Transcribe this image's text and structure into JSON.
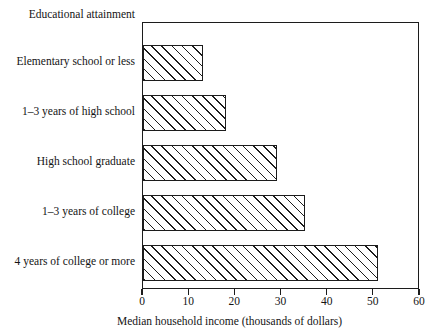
{
  "chart_data": {
    "type": "bar",
    "orientation": "horizontal",
    "title": "",
    "series_title": "Educational attainment",
    "categories": [
      "Elementary school or less",
      "1–3 years of high school",
      "High school graduate",
      "1–3 years of college",
      "4 years of college or more"
    ],
    "values": [
      13,
      18,
      29,
      35,
      51
    ],
    "xlabel": "Median household income (thousands of dollars)",
    "ylabel": "Educational attainment",
    "xlim": [
      0,
      60
    ],
    "xticks": [
      0,
      10,
      20,
      30,
      40,
      50,
      60
    ],
    "xtick_labels": [
      "0",
      "10",
      "20",
      "30",
      "40",
      "50",
      "60"
    ],
    "grid": false,
    "legend": false,
    "bar_fill": "diagonal-hatch",
    "bar_color": "#ffffff",
    "line_color": "#1c1c1c"
  }
}
